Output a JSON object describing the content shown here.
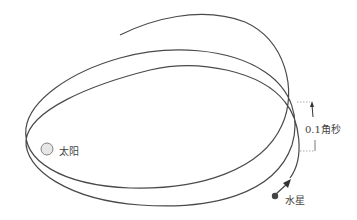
{
  "diagram": {
    "labels": {
      "sun": "太阳",
      "mercury": "水星",
      "shift": "0.1角秒"
    },
    "colors": {
      "orbit": "#4a4a4a",
      "sun_fill": "#e6e6e6",
      "sun_stroke": "#666666",
      "mercury": "#444444",
      "bracket": "#888888"
    }
  }
}
